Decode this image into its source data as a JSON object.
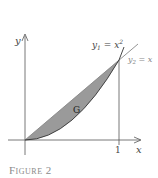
{
  "figure": {
    "caption": "Figure 2",
    "region_label": "G",
    "axis_x_label": "x",
    "axis_y_label": "y",
    "tick_x_label": "1",
    "curve1_label_var": "y",
    "curve1_label_sub": "1",
    "curve1_label_rhs": " = x",
    "curve1_label_exp": "2",
    "curve2_label_var": "y",
    "curve2_label_sub": "2",
    "curve2_label_rhs": " = x"
  },
  "colors": {
    "region_fill": "#9a9a9a",
    "axis": "#555555",
    "curve": "#333333",
    "line": "#888888",
    "caption": "#8a8a8a"
  }
}
